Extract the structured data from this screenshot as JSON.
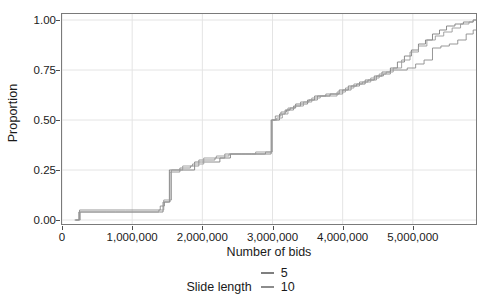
{
  "chart_data": {
    "type": "line",
    "title": "",
    "subtitle": "",
    "xlabel": "Number of bids",
    "ylabel": "Proportion",
    "xlim": [
      0,
      5900000
    ],
    "ylim": [
      -0.02,
      1.03
    ],
    "grid": true,
    "legend_position": "bottom",
    "legend_title": "Slide length",
    "x_ticks": [
      {
        "value": 0,
        "label": "0"
      },
      {
        "value": 1000000,
        "label": "1,000,000"
      },
      {
        "value": 2000000,
        "label": "2,000,000"
      },
      {
        "value": 3000000,
        "label": "3,000,000"
      },
      {
        "value": 4000000,
        "label": "4,000,000"
      },
      {
        "value": 5000000,
        "label": "5,000,000"
      }
    ],
    "y_ticks": [
      {
        "value": 0.0,
        "label": "0.00"
      },
      {
        "value": 0.25,
        "label": "0.25"
      },
      {
        "value": 0.5,
        "label": "0.50"
      },
      {
        "value": 0.75,
        "label": "0.75"
      },
      {
        "value": 1.0,
        "label": "1.00"
      }
    ],
    "series": [
      {
        "name": "5",
        "color": "#7f7f7f",
        "step": "post",
        "x": [
          180000,
          240000,
          640000,
          1390000,
          1440000,
          1520000,
          1530000,
          1700000,
          1890000,
          1990000,
          2250000,
          2400000,
          2620000,
          2700000,
          2880000,
          2980000,
          3020000,
          3100000,
          3180000,
          3250000,
          3330000,
          3500000,
          3600000,
          3700000,
          3820000,
          3950000,
          4080000,
          4200000,
          4320000,
          4450000,
          4560000,
          4680000,
          4780000,
          4880000,
          4980000,
          5080000,
          5180000,
          5280000,
          5380000,
          5480000,
          5600000,
          5720000,
          5860000
        ],
        "y": [
          0.0,
          0.04,
          0.04,
          0.04,
          0.09,
          0.09,
          0.25,
          0.25,
          0.29,
          0.29,
          0.31,
          0.33,
          0.33,
          0.33,
          0.33,
          0.5,
          0.5,
          0.53,
          0.55,
          0.56,
          0.58,
          0.6,
          0.62,
          0.62,
          0.63,
          0.65,
          0.67,
          0.68,
          0.7,
          0.72,
          0.74,
          0.76,
          0.79,
          0.82,
          0.85,
          0.88,
          0.9,
          0.93,
          0.95,
          0.97,
          0.98,
          0.99,
          1.0
        ]
      },
      {
        "name": "10",
        "color": "#8c8c8c",
        "step": "post",
        "x": [
          190000,
          250000,
          900000,
          1400000,
          1460000,
          1520000,
          1540000,
          1680000,
          1830000,
          1950000,
          2180000,
          2320000,
          2560000,
          2700000,
          2900000,
          2990000,
          3040000,
          3120000,
          3200000,
          3300000,
          3400000,
          3520000,
          3640000,
          3760000,
          3880000,
          4000000,
          4120000,
          4240000,
          4360000,
          4480000,
          4580000,
          4680000,
          4800000,
          4920000,
          5040000,
          5160000,
          5280000,
          5400000,
          5520000,
          5640000,
          5760000,
          5860000
        ],
        "y": [
          0.0,
          0.05,
          0.05,
          0.07,
          0.09,
          0.09,
          0.24,
          0.26,
          0.27,
          0.3,
          0.31,
          0.33,
          0.33,
          0.33,
          0.34,
          0.5,
          0.52,
          0.54,
          0.55,
          0.57,
          0.59,
          0.6,
          0.62,
          0.63,
          0.63,
          0.65,
          0.67,
          0.69,
          0.7,
          0.72,
          0.73,
          0.75,
          0.75,
          0.76,
          0.78,
          0.8,
          0.86,
          0.87,
          0.88,
          0.9,
          0.93,
          0.95
        ]
      },
      {
        "name": "20",
        "color": "#999999",
        "step": "post",
        "x": [
          200000,
          260000,
          760000,
          1380000,
          1450000,
          1520000,
          1560000,
          1720000,
          1860000,
          2020000,
          2200000,
          2380000,
          2600000,
          2760000,
          2920000,
          2995000,
          3060000,
          3140000,
          3220000,
          3320000,
          3440000,
          3560000,
          3680000,
          3800000,
          3920000,
          4040000,
          4160000,
          4280000,
          4400000,
          4520000,
          4620000,
          4720000,
          4840000,
          4960000,
          5080000,
          5200000,
          5320000,
          5440000,
          5560000,
          5680000,
          5800000,
          5860000
        ],
        "y": [
          0.0,
          0.04,
          0.04,
          0.05,
          0.1,
          0.1,
          0.25,
          0.27,
          0.28,
          0.31,
          0.32,
          0.33,
          0.33,
          0.34,
          0.34,
          0.5,
          0.51,
          0.53,
          0.56,
          0.57,
          0.59,
          0.61,
          0.62,
          0.62,
          0.64,
          0.66,
          0.68,
          0.69,
          0.71,
          0.73,
          0.74,
          0.76,
          0.8,
          0.84,
          0.87,
          0.9,
          0.92,
          0.94,
          0.96,
          0.98,
          0.99,
          1.0
        ]
      }
    ],
    "legend_entries": [
      {
        "label": "5",
        "color": "#7f7f7f"
      },
      {
        "label": "10",
        "color": "#8c8c8c"
      },
      {
        "label": "20",
        "color": "#999999"
      }
    ],
    "panel": {
      "border_color": "#7a7a7a",
      "grid_color": "#e4e4e4",
      "background": "#ffffff"
    }
  }
}
